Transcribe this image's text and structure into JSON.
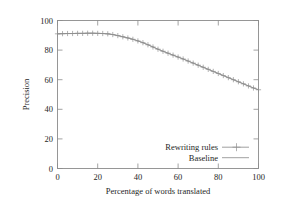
{
  "chart_data": {
    "type": "line",
    "title": "",
    "xlabel": "Percentage of words translated",
    "ylabel": "Precision",
    "xlim": [
      0,
      100
    ],
    "ylim": [
      0,
      100
    ],
    "xticks": [
      0,
      20,
      40,
      60,
      80,
      100
    ],
    "yticks": [
      0,
      20,
      40,
      60,
      80,
      100
    ],
    "grid": false,
    "legend_position": "inside lower right",
    "x": [
      0,
      2.5,
      5,
      7.5,
      10,
      12.5,
      15,
      17.5,
      20,
      22.5,
      25,
      27.5,
      30,
      32.5,
      35,
      37.5,
      40,
      42.5,
      45,
      47.5,
      50,
      52.5,
      55,
      57.5,
      60,
      62.5,
      65,
      67.5,
      70,
      72.5,
      75,
      77.5,
      80,
      82.5,
      85,
      87.5,
      90,
      92.5,
      95,
      97.5,
      100
    ],
    "series": [
      {
        "name": "Rewriting rules",
        "marker": "plus",
        "values": [
          91.0,
          91.1,
          91.2,
          91.2,
          91.3,
          91.3,
          91.4,
          91.4,
          91.3,
          91.2,
          91.0,
          90.5,
          89.8,
          89.0,
          88.2,
          87.3,
          86.2,
          85.0,
          83.6,
          82.1,
          80.6,
          79.2,
          77.9,
          76.6,
          75.3,
          74.0,
          72.6,
          71.2,
          69.8,
          68.4,
          67.0,
          65.6,
          64.2,
          62.8,
          61.4,
          60.0,
          58.6,
          57.2,
          55.8,
          54.4,
          53.2
        ]
      },
      {
        "name": "Baseline",
        "marker": "none",
        "values": [
          91.0,
          91.1,
          91.2,
          91.2,
          91.3,
          91.3,
          91.4,
          91.4,
          91.3,
          91.2,
          91.0,
          90.5,
          89.8,
          89.0,
          88.2,
          87.3,
          86.2,
          85.0,
          83.6,
          82.1,
          80.6,
          79.2,
          77.9,
          76.6,
          75.3,
          74.0,
          72.6,
          71.2,
          69.8,
          68.4,
          67.0,
          65.6,
          64.2,
          62.8,
          61.4,
          60.0,
          58.6,
          57.2,
          55.8,
          54.4,
          53.2
        ]
      }
    ]
  },
  "axis": {
    "x_title": "Percentage of words translated",
    "y_title": "Precision",
    "x_tick_labels": [
      "0",
      "20",
      "40",
      "60",
      "80",
      "100"
    ],
    "y_tick_labels": [
      "0",
      "20",
      "40",
      "60",
      "80",
      "100"
    ]
  },
  "legend": {
    "entries": [
      {
        "label": "Rewriting rules"
      },
      {
        "label": "Baseline"
      }
    ]
  },
  "colors": {
    "series": "#8f8f8f",
    "frame": "#8c8c8c",
    "text": "#262626",
    "background": "#ffffff"
  }
}
